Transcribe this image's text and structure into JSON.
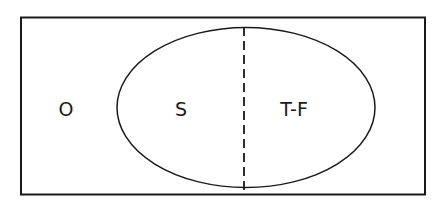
{
  "diagram": {
    "type": "venn",
    "universe": {
      "label": "O"
    },
    "set": {
      "divided_by": "dashed-line",
      "regions": [
        {
          "label": "S"
        },
        {
          "label": "T-F"
        }
      ]
    }
  },
  "colors": {
    "stroke": "#1a1a1a",
    "background": "#ffffff"
  }
}
